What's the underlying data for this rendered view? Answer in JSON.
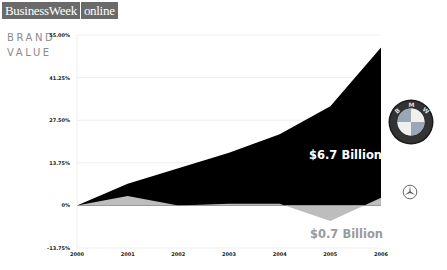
{
  "header": {
    "logo_part1": "BusinessWeek",
    "logo_part2": "online",
    "brand_line1": "BRAND",
    "brand_line2": "VALUE"
  },
  "labels": {
    "bmw_value": "$6.7 Billion",
    "mercedes_value": "$0.7 Billion"
  },
  "colors": {
    "bmw_series": "#000000",
    "mercedes_series": "#bdbdbd",
    "grid": "#eeeeee"
  },
  "chart_data": {
    "type": "area",
    "title": "BRAND VALUE",
    "xlabel": "",
    "ylabel": "",
    "x": [
      "2000",
      "2001",
      "2002",
      "2003",
      "2004",
      "2005",
      "2006"
    ],
    "y_ticks": [
      "55.00%",
      "41.25%",
      "27.50%",
      "13.75%",
      "0%",
      "-13.75%"
    ],
    "ylim": [
      -13.75,
      55.0
    ],
    "grid": true,
    "legend": "none",
    "series": [
      {
        "name": "BMW",
        "label": "$6.7 Billion",
        "color": "#000000",
        "values": [
          0,
          7,
          12,
          17,
          23,
          32,
          51
        ]
      },
      {
        "name": "Mercedes-Benz",
        "label": "$0.7 Billion",
        "color": "#bdbdbd",
        "values": [
          0,
          3,
          0,
          0.5,
          0.5,
          -5,
          2.5
        ]
      }
    ],
    "annotations": [
      "$6.7 Billion",
      "$0.7 Billion"
    ]
  }
}
